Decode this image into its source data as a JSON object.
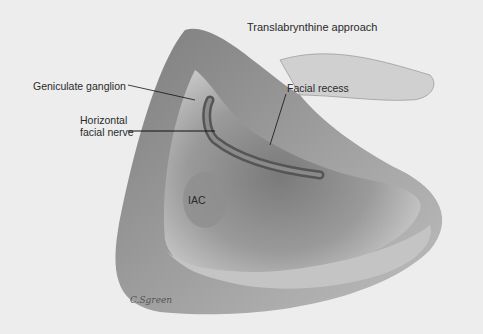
{
  "figure": {
    "title": "Translabrynthine approach",
    "labels": {
      "geniculate": "Geniculate ganglion",
      "horizontal_line1": "Horizontal",
      "horizontal_line2": "facial nerve",
      "facial_recess": "Facial recess",
      "iac": "IAC"
    },
    "signature": "C.Sgreen"
  }
}
